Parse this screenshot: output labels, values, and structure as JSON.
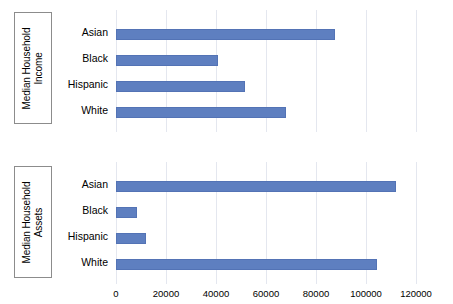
{
  "chart_data": [
    {
      "type": "bar",
      "orientation": "horizontal",
      "title": "",
      "xlabel": "",
      "ylabel": "Median Household Income",
      "ylabel_line1": "Median Household",
      "ylabel_line2": "Income",
      "categories": [
        "Asian",
        "Black",
        "Hispanic",
        "White"
      ],
      "values": [
        87300,
        40500,
        51300,
        67700
      ],
      "xlim": [
        0,
        120000
      ],
      "xticks": [
        0,
        20000,
        40000,
        60000,
        80000,
        100000,
        120000
      ],
      "xticklabels": [
        "0",
        "20000",
        "40000",
        "60000",
        "80000",
        "100000",
        "120000"
      ],
      "grid": true,
      "legend": false,
      "bar_color": "#5e7fc0"
    },
    {
      "type": "bar",
      "orientation": "horizontal",
      "title": "",
      "xlabel": "",
      "ylabel": "Median Household Assets",
      "ylabel_line1": "Median Household",
      "ylabel_line2": "Assets",
      "categories": [
        "Asian",
        "Black",
        "Hispanic",
        "White"
      ],
      "values": [
        111500,
        8500,
        12100,
        104100
      ],
      "xlim": [
        0,
        120000
      ],
      "xticks": [
        0,
        20000,
        40000,
        60000,
        80000,
        100000,
        120000
      ],
      "xticklabels": [
        "0",
        "20000",
        "40000",
        "60000",
        "80000",
        "100000",
        "120000"
      ],
      "grid": true,
      "legend": false,
      "bar_color": "#5e7fc0"
    }
  ],
  "colors": {
    "bar": "#5e7fc0",
    "bar_edge": "#5373b5",
    "grid": "#e4e7ef",
    "box_border": "#8c8c8c",
    "text": "#000000",
    "background": "#ffffff"
  }
}
